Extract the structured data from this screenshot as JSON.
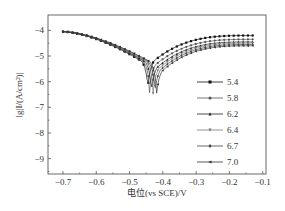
{
  "chart_data": {
    "type": "line",
    "title": "",
    "xlabel": "电位(vs SCE)/V",
    "ylabel": "lg|I/(A/cm²)|",
    "xlim": [
      -0.745,
      -0.09
    ],
    "ylim": [
      -9.6,
      -3.4
    ],
    "x_ticks": [
      -0.7,
      -0.6,
      -0.5,
      -0.4,
      -0.3,
      -0.2,
      -0.1
    ],
    "x_tick_labels": [
      "−0.7",
      "−0.6",
      "−0.5",
      "−0.4",
      "−0.3",
      "−0.2",
      "−0.1"
    ],
    "y_ticks": [
      -4,
      -5,
      -6,
      -7,
      -8,
      -9
    ],
    "y_tick_labels": [
      "−4",
      "−5",
      "−6",
      "−7",
      "−8",
      "−9"
    ],
    "grid": false,
    "legend_position": "inside-lower-right",
    "series": [
      {
        "name": "5.4",
        "marker": "square",
        "color": "#111111",
        "corrosion_potential": -0.445,
        "min_log_i": -7.3,
        "start_log_i": -4.05,
        "end_log_i": -4.2
      },
      {
        "name": "5.8",
        "marker": "circle",
        "color": "#555555",
        "corrosion_potential": -0.44,
        "min_log_i": -7.6,
        "start_log_i": -4.05,
        "end_log_i": -4.35
      },
      {
        "name": "6.2",
        "marker": "triangle-up",
        "color": "#222222",
        "corrosion_potential": -0.435,
        "min_log_i": -8.0,
        "start_log_i": -4.05,
        "end_log_i": -4.45
      },
      {
        "name": "6.4",
        "marker": "triangle-down",
        "color": "#777777",
        "corrosion_potential": -0.43,
        "min_log_i": -8.4,
        "start_log_i": -4.05,
        "end_log_i": -4.5
      },
      {
        "name": "6.7",
        "marker": "diamond",
        "color": "#444444",
        "corrosion_potential": -0.425,
        "min_log_i": -8.6,
        "start_log_i": -4.05,
        "end_log_i": -4.55
      },
      {
        "name": "7.0",
        "marker": "triangle-left",
        "color": "#333333",
        "corrosion_potential": -0.42,
        "min_log_i": -8.9,
        "start_log_i": -4.05,
        "end_log_i": -4.6
      }
    ]
  }
}
